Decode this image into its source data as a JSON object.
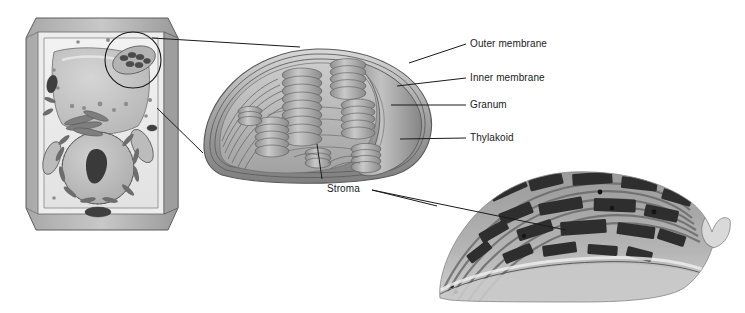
{
  "figure": {
    "background_color": "#ffffff",
    "line_color": "#1b1b1b",
    "text_color": "#1b1b1b"
  },
  "panels": [
    {
      "name": "plant-cell-illustration",
      "description": "Cutaway drawing of a plant cell showing cell wall, vacuole, nucleus and chloroplasts",
      "x": 18,
      "y": 8,
      "width": 170,
      "height": 228,
      "features": [
        "cell wall",
        "vacuole",
        "nucleus",
        "nucleolus",
        "golgi",
        "endoplasmic reticulum",
        "chloroplast",
        "mitochondria"
      ],
      "callout_circle": {
        "cx": 133,
        "cy": 60,
        "r": 28
      }
    },
    {
      "name": "chloroplast-diagram",
      "description": "Three dimensional cutaway of a chloroplast showing grana stacks of thylakoids within the stroma",
      "x": 198,
      "y": 45,
      "width": 244,
      "height": 140
    },
    {
      "name": "chloroplast-micrograph",
      "description": "Transmission electron micrograph of a chloroplast showing dark stacked grana",
      "x": 432,
      "y": 172,
      "width": 300,
      "height": 136
    }
  ],
  "labels": [
    {
      "id": "outer-membrane",
      "text": "Outer membrane",
      "x": 470,
      "y": 38
    },
    {
      "id": "inner-membrane",
      "text": "Inner membrane",
      "x": 470,
      "y": 72
    },
    {
      "id": "granum",
      "text": "Granum",
      "x": 470,
      "y": 99
    },
    {
      "id": "thylakoid",
      "text": "Thylakoid",
      "x": 470,
      "y": 132
    },
    {
      "id": "stroma",
      "text": "Stroma",
      "x": 327,
      "y": 183
    }
  ],
  "leader_lines": [
    {
      "id": "outer-membrane-leader",
      "from": [
        459,
        44
      ],
      "to": [
        409,
        63
      ]
    },
    {
      "id": "inner-membrane-leader",
      "from": [
        459,
        78
      ],
      "to": [
        397,
        86
      ]
    },
    {
      "id": "granum-leader",
      "from": [
        459,
        105
      ],
      "to": [
        393,
        105
      ]
    },
    {
      "id": "thylakoid-leader",
      "from": [
        459,
        138
      ],
      "to": [
        400,
        139
      ]
    },
    {
      "id": "stroma-leader-diagram",
      "from": [
        322,
        179
      ],
      "to": [
        317,
        144
      ]
    },
    {
      "id": "stroma-leader-micrograph",
      "from": [
        372,
        190
      ],
      "to": [
        560,
        228
      ]
    },
    {
      "id": "stroma-leader-micrograph-2",
      "from": [
        372,
        190
      ],
      "to": [
        437,
        208
      ]
    },
    {
      "id": "cell-to-chloroplast-top",
      "from": [
        152,
        38
      ],
      "to": [
        300,
        47
      ]
    },
    {
      "id": "cell-to-chloroplast-bottom",
      "from": [
        157,
        108
      ],
      "to": [
        203,
        153
      ]
    }
  ]
}
